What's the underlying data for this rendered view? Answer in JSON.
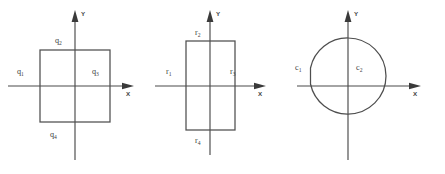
{
  "figure": {
    "caption": "",
    "colors": {
      "stroke": "#4e4e4e",
      "axis": "#4a4a4a",
      "text": "#3d3d3d",
      "background": "#ffffff"
    },
    "panels": [
      {
        "id": "square",
        "shape": "square",
        "axis_labels": {
          "x": "X",
          "y": "Y"
        },
        "region_labels": [
          {
            "base": "q",
            "sub": "1",
            "position": "left-outside"
          },
          {
            "base": "q",
            "sub": "2",
            "position": "top-inside"
          },
          {
            "base": "q",
            "sub": "3",
            "position": "right-inside"
          },
          {
            "base": "q",
            "sub": "4",
            "position": "bottom-outside"
          }
        ]
      },
      {
        "id": "rectangle",
        "shape": "rectangle",
        "axis_labels": {
          "x": "X",
          "y": "Y"
        },
        "region_labels": [
          {
            "base": "r",
            "sub": "1",
            "position": "left-outside"
          },
          {
            "base": "r",
            "sub": "2",
            "position": "top-inside"
          },
          {
            "base": "r",
            "sub": "3",
            "position": "right-inside"
          },
          {
            "base": "r",
            "sub": "4",
            "position": "bottom-outside"
          }
        ]
      },
      {
        "id": "circle",
        "shape": "circle",
        "axis_labels": {
          "x": "X",
          "y": "Y"
        },
        "region_labels": [
          {
            "base": "c",
            "sub": "1",
            "position": "left-outside"
          },
          {
            "base": "c",
            "sub": "2",
            "position": "right-inside"
          }
        ]
      }
    ]
  },
  "labels": {
    "q1_base": "q",
    "q1_sub": "1",
    "q2_base": "q",
    "q2_sub": "2",
    "q3_base": "q",
    "q3_sub": "3",
    "q4_base": "q",
    "q4_sub": "4",
    "r1_base": "r",
    "r1_sub": "1",
    "r2_base": "r",
    "r2_sub": "2",
    "r3_base": "r",
    "r3_sub": "3",
    "r4_base": "r",
    "r4_sub": "4",
    "c1_base": "c",
    "c1_sub": "1",
    "c2_base": "c",
    "c2_sub": "2",
    "axis_x_1": "X",
    "axis_y_1": "Y",
    "axis_x_2": "X",
    "axis_y_2": "Y",
    "axis_x_3": "X",
    "axis_y_3": "Y"
  }
}
